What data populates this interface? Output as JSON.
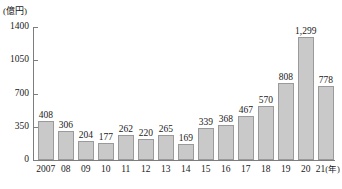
{
  "chart_data": {
    "type": "bar",
    "title": "",
    "subtitle": "",
    "xlabel": "(年)",
    "ylabel": "(億円)",
    "unit_caption": "(億円)",
    "x_axis_unit_suffix": "(年)",
    "categories": [
      "2007",
      "08",
      "09",
      "10",
      "11",
      "12",
      "13",
      "14",
      "15",
      "16",
      "17",
      "18",
      "19",
      "20",
      "21"
    ],
    "values": [
      408,
      306,
      204,
      177,
      262,
      220,
      265,
      169,
      339,
      368,
      467,
      570,
      808,
      1299,
      778
    ],
    "value_labels": [
      "408",
      "306",
      "204",
      "177",
      "262",
      "220",
      "265",
      "169",
      "339",
      "368",
      "467",
      "570",
      "808",
      "1,299",
      "778"
    ],
    "ylim": [
      0,
      1400
    ],
    "y_ticks": [
      0,
      350,
      700,
      1050,
      1400
    ],
    "y_tick_labels": [
      "0",
      "350",
      "700",
      "1050",
      "1400"
    ],
    "grid": false,
    "legend": null,
    "legend_position": "none",
    "colors": {
      "bar_fill": "#c9c9c9",
      "bar_border": "#9a9a9a",
      "axis": "#7d7d7d",
      "text": "#1a1a1a",
      "background": "#ffffff"
    }
  }
}
